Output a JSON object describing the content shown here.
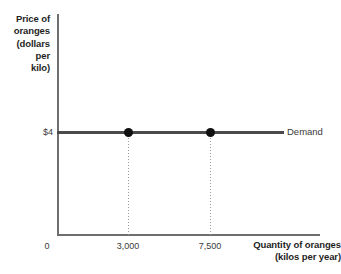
{
  "chart_data": {
    "type": "line",
    "title": "",
    "subtitle": "",
    "xlabel": "Quantity of oranges\n(kilos per year)",
    "ylabel": "Price of oranges\n(dollars per kilo)",
    "grid": false,
    "legend_position": "right-inline",
    "xlim": [
      0,
      9500
    ],
    "ylim": [
      0,
      10
    ],
    "x_tick_labels": [
      "0",
      "3,000",
      "7,500"
    ],
    "x_tick_values": [
      0,
      3000,
      7500
    ],
    "y_tick_labels": [
      "$4"
    ],
    "y_tick_values": [
      4
    ],
    "series": [
      {
        "name": "Demand",
        "kind": "horizontal-line",
        "y_value": 4,
        "x_start": 0,
        "x_end": 8200,
        "color": "#4a4a4a",
        "points": [
          {
            "x": 3000,
            "y": 4,
            "label": "3,000"
          },
          {
            "x": 7500,
            "y": 4,
            "label": "7,500"
          }
        ]
      }
    ],
    "annotations": [
      {
        "type": "drop-line",
        "x": 3000,
        "from_y": 4,
        "to_y": 0,
        "style": "dotted"
      },
      {
        "type": "drop-line",
        "x": 7500,
        "from_y": 4,
        "to_y": 0,
        "style": "dotted"
      }
    ]
  },
  "axes": {
    "y_title_lines": [
      "Price of",
      "oranges",
      "(dollars",
      "per",
      "kilo)"
    ],
    "x_title_lines": [
      "Quantity of oranges",
      "(kilos per year)"
    ],
    "y_value_label": "$4",
    "origin_label": "0",
    "x_tick_1": "3,000",
    "x_tick_2": "7,500",
    "axis_color": "#6e6e6e"
  },
  "series_label": {
    "demand": "Demand"
  },
  "colors": {
    "background": "#ffffff",
    "axis": "#6e6e6e",
    "demand_line": "#4a4a4a",
    "marker": "#101010",
    "drop_line": "#9a9a9a",
    "text": "#2b2b2b"
  }
}
